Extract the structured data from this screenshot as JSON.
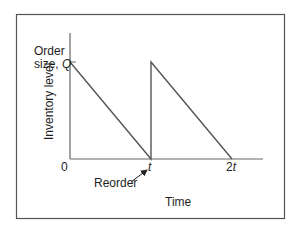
{
  "diagram": {
    "title_left": "Order",
    "title_left_line2": "size, ",
    "q_symbol": "Q",
    "y_axis_label": "Inventory level",
    "x_axis_label": "Time",
    "origin_label": "0",
    "tick_t": "t",
    "tick_2t_prefix": "2",
    "tick_2t_var": "t",
    "reorder_label": "Reorder",
    "colors": {
      "frame": "#555555",
      "axes": "#666666",
      "line": "#555555",
      "text": "#1e1e1e"
    }
  }
}
